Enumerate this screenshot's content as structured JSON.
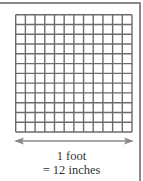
{
  "figure": {
    "grid": {
      "rows": 12,
      "cols": 12,
      "line_color": "#6b6b6b",
      "fill_color": "#ffffff"
    },
    "arrow": {
      "type": "double-headed",
      "color": "#8a8a8a"
    },
    "caption": {
      "line1": "1 foot",
      "line2": "= 12 inches"
    }
  }
}
